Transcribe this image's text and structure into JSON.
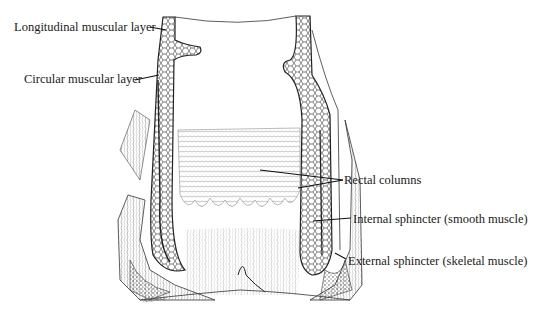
{
  "diagram": {
    "type": "anatomical line drawing",
    "labels": [
      {
        "id": "longitudinal",
        "text": "Longitudinal muscular layer"
      },
      {
        "id": "circular",
        "text": "Circular muscular layer"
      },
      {
        "id": "rectal_columns",
        "text": "Rectal columns"
      },
      {
        "id": "internal_sphincter",
        "text": "Internal sphincter (smooth muscle)"
      },
      {
        "id": "external_sphincter",
        "text": "External sphincter (skeletal muscle)"
      }
    ],
    "signature": "A.H.Ancy"
  },
  "colors": {
    "ink": "#1a1a1a",
    "background": "#ffffff"
  }
}
